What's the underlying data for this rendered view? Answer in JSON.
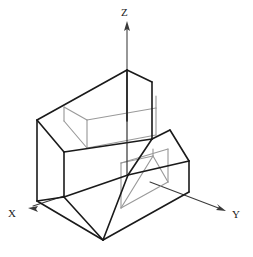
{
  "figure": {
    "kind": "isometric-technical-drawing",
    "background_color": "#ffffff",
    "solid_edge_color": "#1a1a1a",
    "feature_edge_color": "#9a9a9a",
    "axis_color": "#3a3a3a"
  },
  "axes": {
    "x": {
      "label": "X",
      "label_x": 11,
      "label_y": 216,
      "origin_x": 64,
      "origin_y": 196,
      "tip_x": 29,
      "tip_y": 207
    },
    "y": {
      "label": "Y",
      "label_x": 237,
      "label_y": 217,
      "origin_x": 128,
      "origin_y": 174,
      "tip_x": 224,
      "tip_y": 210
    },
    "z": {
      "label": "Z",
      "label_x": 124,
      "label_y": 15,
      "origin_x": 127,
      "origin_y": 120,
      "tip_x": 127,
      "tip_y": 22
    }
  },
  "geometry": {
    "outline": "M37,120 L127,70 L152,82 L152,139 L170,130 L189,160 L189,192 L103,240 L37,200 Z",
    "vertices": {
      "back_left_top": [
        37,
        120
      ],
      "front_top_apex": [
        127,
        70
      ],
      "right_top_back": [
        152,
        82
      ],
      "step_right": [
        152,
        139
      ],
      "slope_top_right": [
        170,
        130
      ],
      "right_outer": [
        189,
        160
      ],
      "right_lower": [
        189,
        192
      ],
      "bottom_apex": [
        103,
        240
      ],
      "left_lower": [
        37,
        200
      ],
      "mid_front": [
        64,
        196
      ],
      "step_front": [
        128,
        174
      ],
      "step_left": [
        64,
        152
      ]
    }
  },
  "edges": {
    "solid": [
      "M37,120 L127,70",
      "M127,70 L152,82",
      "M152,82 L152,139",
      "M37,120 L37,200",
      "M37,120 L64,152",
      "M64,152 L152,139",
      "M64,152 L64,196",
      "M127,70 L127,120",
      "M127,120 L127,174",
      "M64,196 L128,174",
      "M128,174 L152,139",
      "M37,200 L64,196",
      "M37,200 L103,240",
      "M103,240 L189,192",
      "M189,192 L189,160",
      "M152,139 L170,130",
      "M170,130 L189,160",
      "M128,174 L189,160",
      "M128,174 L103,240",
      "M64,196 L103,240"
    ],
    "feature_gray": [
      "M64,107 L87,120",
      "M87,120 L87,147",
      "M87,120 L155,108",
      "M155,108 L155,96",
      "M87,147 L155,134",
      "M155,134 L155,108",
      "M64,107 L64,120",
      "M120,207 L120,163",
      "M120,207 L167,181",
      "M167,181 L167,148",
      "M120,163 L167,148",
      "M120,207 L152,155",
      "M120,163 L152,155",
      "M167,181 L152,155"
    ]
  }
}
